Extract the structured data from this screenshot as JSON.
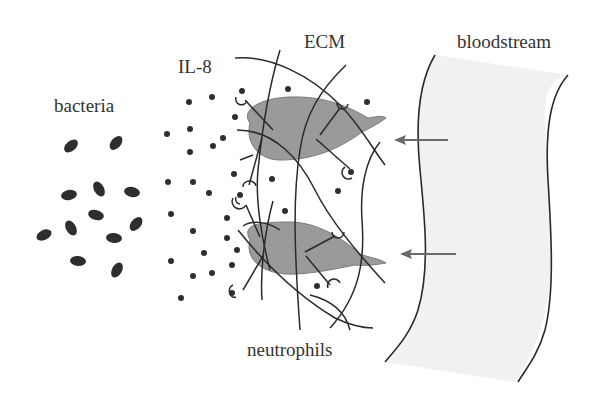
{
  "labels": {
    "bacteria": "bacteria",
    "il8": "IL-8",
    "ecm": "ECM",
    "bloodstream": "bloodstream",
    "neutrophils": "neutrophils"
  },
  "colors": {
    "ink": "#2a2a2a",
    "neutrophil_fill": "#9a9a9a",
    "bloodstream_fill": "#f1f1f1",
    "arrow": "#6a6a6a"
  },
  "figure": {
    "bacteria_count": 12,
    "neutrophil_count": 2,
    "migration_arrows": 2,
    "migration_direction": "bloodstream → ECM (leftward)"
  }
}
